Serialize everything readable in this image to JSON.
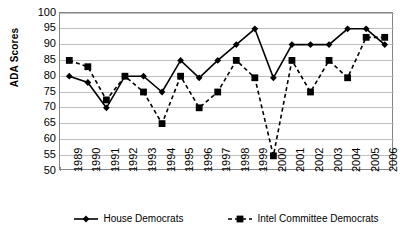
{
  "chart_data": {
    "type": "line",
    "title": "",
    "xlabel": "",
    "ylabel": "ADA Scores",
    "ylim": [
      50,
      100
    ],
    "ytick_step": 5,
    "grid": true,
    "legend_position": "bottom",
    "categories": [
      "1989",
      "1990",
      "1991",
      "1992",
      "1993",
      "1994",
      "1995",
      "1996",
      "1997",
      "1998",
      "1999",
      "2000",
      "2001",
      "2002",
      "2003",
      "2004",
      "2005",
      "2006"
    ],
    "yticks": [
      "100",
      "95",
      "90",
      "85",
      "80",
      "75",
      "70",
      "65",
      "60",
      "55",
      "50"
    ],
    "series": [
      {
        "name": "House Democrats",
        "marker": "diamond",
        "line_style": "solid",
        "color": "#000000",
        "values": [
          80,
          78,
          70,
          80,
          80,
          75,
          85,
          79.5,
          85,
          90,
          95,
          79.5,
          90,
          90,
          90,
          95,
          95,
          90
        ]
      },
      {
        "name": "Intel Committee Democrats",
        "marker": "square",
        "line_style": "dashed",
        "color": "#000000",
        "values": [
          85,
          83,
          72.5,
          80,
          75,
          65,
          80,
          70,
          75,
          85,
          79.5,
          54.8,
          85,
          75,
          85,
          79.5,
          92.3,
          92.3
        ]
      }
    ]
  },
  "legend": {
    "items": [
      {
        "label": "House Democrats",
        "marker": "diamond",
        "line_style": "solid"
      },
      {
        "label": "Intel Committee Democrats",
        "marker": "square",
        "line_style": "dashed"
      }
    ]
  },
  "axis": {
    "y_title": "ADA Scores"
  },
  "colors": {
    "series": "#000000",
    "grid": "#bfbfbf",
    "frame": "#868686",
    "background": "#ffffff"
  }
}
